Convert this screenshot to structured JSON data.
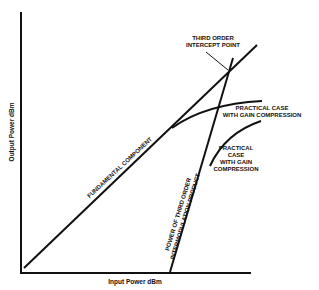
{
  "axes": {
    "x_label": "Input Power dBm",
    "y_label": "Output Power dBm"
  },
  "annotations": {
    "intercept_line1": "THIRD ORDER",
    "intercept_line2": "INTERCEPT POINT",
    "practical_upper_line1": "PRACTICAL CASE",
    "practical_upper_line2": "WITH GAIN COMPRESSION",
    "practical_lower_line1": "PRACTICAL",
    "practical_lower_line2": "CASE",
    "practical_lower_line3": "WITH GAIN",
    "practical_lower_line4": "COMPRESSION",
    "fundamental": "FUNDAMENTAL COMPONENT",
    "third_order_line1": "POWER OF THIRD ORDER",
    "third_order_line2": "INTERMODULATION PRODUCT"
  },
  "colors": {
    "ink": "#111111",
    "background": "#ffffff"
  }
}
